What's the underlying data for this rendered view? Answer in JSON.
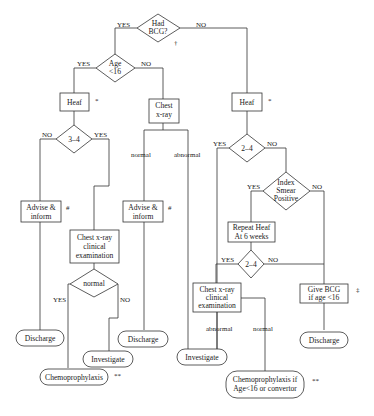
{
  "nodes": {
    "had_bcg": {
      "lines": [
        "Had",
        "BCG?"
      ],
      "mark": "†"
    },
    "age16": {
      "lines": [
        "Age",
        "<16"
      ]
    },
    "heaf_left": {
      "label": "Heaf",
      "mark": "*"
    },
    "chest_xray": {
      "lines": [
        "Chest",
        "x-ray"
      ]
    },
    "heaf_right": {
      "label": "Heaf",
      "mark": "*"
    },
    "d34": {
      "label": "3–4"
    },
    "advise1": {
      "lines": [
        "Advise &",
        "inform"
      ],
      "mark": "#"
    },
    "advise2": {
      "lines": [
        "Advise &",
        "inform"
      ],
      "mark": "#"
    },
    "d24_top": {
      "label": "2–4"
    },
    "index_smear": {
      "lines": [
        "Index",
        "Smear",
        "Positive"
      ]
    },
    "repeat_heaf": {
      "lines": [
        "Repeat Heaf",
        "At 6 weeks"
      ]
    },
    "d24_bottom": {
      "label": "2–4"
    },
    "cxr_left": {
      "lines": [
        "Chest x-ray",
        "clinical",
        "examination"
      ]
    },
    "cxr_right": {
      "lines": [
        "Chest x-ray",
        "clinical",
        "examination"
      ]
    },
    "normal_d": {
      "label": "normal"
    },
    "give_bcg": {
      "lines": [
        "Give BCG",
        "if age <16"
      ],
      "mark": "‡"
    },
    "discharge1": {
      "label": "Discharge"
    },
    "discharge2": {
      "label": "Discharge"
    },
    "discharge3": {
      "label": "Discharge"
    },
    "investigate1": {
      "label": "Investigate"
    },
    "investigate2": {
      "label": "Investigate"
    },
    "chemo1": {
      "label": "Chemoprophylaxis",
      "mark": "**"
    },
    "chemo2": {
      "lines": [
        "Chemoprophylaxis if",
        "Age<16 or convertor"
      ],
      "mark": "**"
    }
  },
  "edges": {
    "yes": "YES",
    "no": "NO",
    "normal": "normal",
    "abnormal": "abnormal"
  }
}
